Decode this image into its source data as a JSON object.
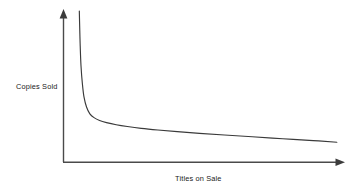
{
  "chart_data": {
    "type": "line",
    "title": "",
    "subtitle": "",
    "xlabel": "Titles on Sale",
    "ylabel": "Copies Sold",
    "grid": false,
    "legend": null,
    "annotations": [],
    "axis_style": "arrow-axes-no-ticks",
    "xticks": [],
    "yticks": [],
    "xlim": [
      0,
      100
    ],
    "ylim": [
      0,
      100
    ],
    "series": [
      {
        "name": "Demand curve",
        "color": "#3a3a3a",
        "x": [
          5.7,
          5.8,
          6.0,
          6.3,
          6.8,
          7.4,
          8.3,
          9.5,
          11.0,
          13.0,
          15.5,
          19.0,
          23.0,
          28.0,
          34.0,
          41.0,
          49.0,
          58.0,
          68.0,
          79.0,
          90.0,
          98.5
        ],
        "y": [
          100.0,
          92.0,
          78.0,
          64.0,
          52.0,
          43.0,
          36.5,
          32.0,
          29.5,
          27.6,
          26.2,
          24.8,
          23.6,
          22.4,
          21.3,
          20.2,
          19.1,
          18.0,
          16.8,
          15.5,
          14.3,
          13.2
        ]
      }
    ]
  },
  "colors": {
    "background": "#ffffff",
    "curve": "#3a3a3a",
    "axis": "#4a4a4a",
    "text": "#1a1a1a"
  },
  "labels": {
    "y_axis": "Copies Sold",
    "x_axis": "Titles on Sale"
  }
}
